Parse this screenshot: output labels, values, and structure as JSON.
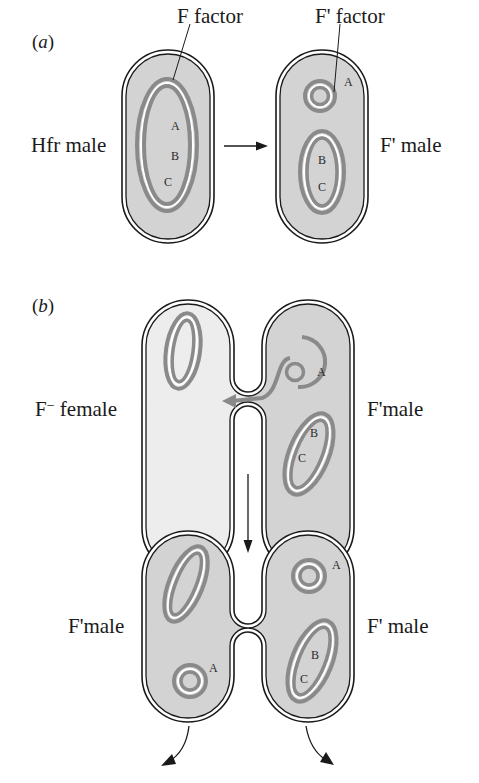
{
  "figure": {
    "panel_a": {
      "label": "a",
      "callouts": {
        "f_factor": "F factor",
        "f_prime_factor": "F' factor"
      },
      "cells": {
        "left": {
          "label": "Hfr male",
          "genes": [
            "A",
            "B",
            "C"
          ]
        },
        "right": {
          "label": "F' male",
          "plasmid_gene": "A",
          "chromosome_genes": [
            "B",
            "C"
          ]
        }
      }
    },
    "panel_b": {
      "label": "b",
      "stage1": {
        "left": {
          "label_main": "F",
          "label_sup": "−",
          "label_rest": " female"
        },
        "right": {
          "label": "F'male",
          "plasmid_gene": "A",
          "chromosome_genes": [
            "B",
            "C"
          ]
        }
      },
      "stage2": {
        "left": {
          "label": "F'male",
          "plasmid_gene": "A"
        },
        "right": {
          "label": "F' male",
          "plasmid_gene": "A",
          "chromosome_genes": [
            "B",
            "C"
          ]
        }
      }
    },
    "colors": {
      "cell_fill": "#d3d3d3",
      "female_fill": "#ededed",
      "dna_ring": "#8a8a8a",
      "outline": "#1a1a1a"
    }
  }
}
